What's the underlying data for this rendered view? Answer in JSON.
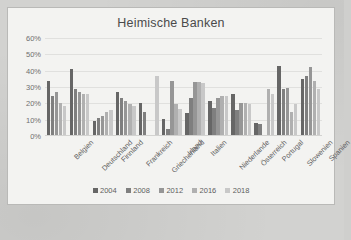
{
  "chart_card": {
    "title": "Heimische Banken"
  },
  "chart_data": {
    "type": "bar",
    "title": "Heimische Banken",
    "xlabel": "",
    "ylabel": "",
    "ylim": [
      0,
      60
    ],
    "ytick_labels": [
      "0%",
      "10%",
      "20%",
      "30%",
      "40%",
      "50%",
      "60%"
    ],
    "ytick_values": [
      0,
      10,
      20,
      30,
      40,
      50,
      60
    ],
    "grid": true,
    "legend_position": "bottom",
    "value_suffix": "%",
    "categories": [
      "Belgien",
      "Deutschland",
      "Finnland",
      "Frankreich",
      "Griechenland",
      "Irland",
      "Italien",
      "Niederlande",
      "Österreich",
      "Portugal",
      "Slowenien",
      "Spanien"
    ],
    "series": [
      {
        "name": "2004",
        "color": "#666666",
        "values": [
          33.5,
          41.0,
          9.0,
          27.0,
          20.0,
          10.5,
          14.0,
          21.5,
          26.0,
          8.0,
          43.0,
          35.0
        ]
      },
      {
        "name": "2008",
        "color": "#7f7f7f",
        "values": [
          24.5,
          28.5,
          11.0,
          23.5,
          14.5,
          4.5,
          23.5,
          17.0,
          16.0,
          7.5,
          28.5,
          36.5
        ]
      },
      {
        "name": "2012",
        "color": "#969696",
        "values": [
          27.0,
          27.0,
          12.5,
          21.5,
          null,
          33.5,
          33.0,
          23.5,
          20.0,
          null,
          29.5,
          42.0
        ]
      },
      {
        "name": "2016",
        "color": "#b0b0b0",
        "values": [
          20.0,
          26.0,
          14.5,
          19.5,
          null,
          19.5,
          33.0,
          24.5,
          20.0,
          28.5,
          15.0,
          33.5
        ]
      },
      {
        "name": "2018",
        "color": "#c8c8c8",
        "values": [
          18.5,
          25.5,
          16.0,
          18.5,
          37.0,
          16.5,
          32.5,
          24.5,
          19.5,
          26.0,
          19.5,
          28.5
        ]
      }
    ]
  }
}
